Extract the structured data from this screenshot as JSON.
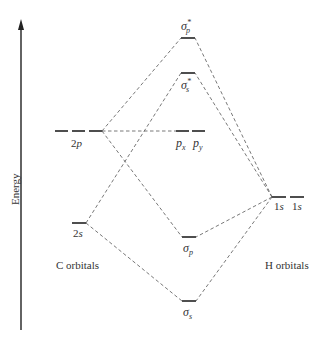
{
  "diagram": {
    "type": "molecular-orbital-energy-diagram",
    "axis": {
      "label": "Energy",
      "direction": "up"
    },
    "groups": {
      "left": "C orbitals",
      "right": "H orbitals"
    },
    "atomic_orbitals_left": [
      {
        "id": "c2p",
        "label_main": "2",
        "label_ital": "p",
        "count": 3
      },
      {
        "id": "c2s",
        "label_main": "2",
        "label_ital": "s",
        "count": 1
      }
    ],
    "atomic_orbitals_right": [
      {
        "id": "h1s_a",
        "label_main": "1",
        "label_ital": "s"
      },
      {
        "id": "h1s_b",
        "label_main": "1",
        "label_ital": "s"
      }
    ],
    "molecular_orbitals": [
      {
        "id": "sigma_p_star",
        "symbol": "σ",
        "sub": "p",
        "sup": "*"
      },
      {
        "id": "sigma_s_star",
        "symbol": "σ",
        "sub": "s",
        "sup": "*"
      },
      {
        "id": "px",
        "symbol": "p",
        "sub": "x"
      },
      {
        "id": "py",
        "symbol": "p",
        "sub": "y"
      },
      {
        "id": "sigma_p",
        "symbol": "σ",
        "sub": "p"
      },
      {
        "id": "sigma_s",
        "symbol": "σ",
        "sub": "s"
      }
    ],
    "colors": {
      "line": "#222222",
      "dash": "#555555",
      "background": "#ffffff"
    }
  }
}
